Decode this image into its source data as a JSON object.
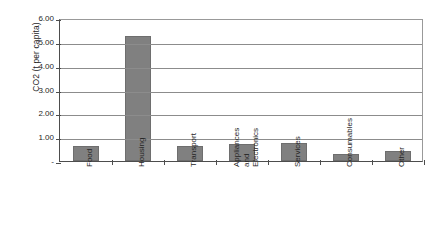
{
  "chart_data": {
    "type": "bar",
    "title": "",
    "xlabel": "",
    "ylabel": "CO2 (t per capita)",
    "categories": [
      "Food",
      "Housing",
      "Transport",
      "Appliances and Electronics",
      "Services",
      "Consumables",
      "Other"
    ],
    "category_lines": [
      [
        "Food"
      ],
      [
        "Housing"
      ],
      [
        "Transport"
      ],
      [
        "Appliances",
        "and",
        "Electronics"
      ],
      [
        "Services"
      ],
      [
        "Consumables"
      ],
      [
        "Other"
      ]
    ],
    "values": [
      0.63,
      5.26,
      0.62,
      0.7,
      0.75,
      0.28,
      0.41
    ],
    "ylim": [
      0,
      6
    ],
    "ytick_values": [
      6,
      5,
      4,
      3,
      2,
      1,
      0
    ],
    "ytick_labels": [
      "6.00",
      "5.00",
      "4.00",
      "3.00",
      "2.00",
      "1.00",
      "-"
    ],
    "grid": true,
    "legend": false,
    "bar_color": "#808080",
    "gridline_color": "#8c8c8c",
    "axis_color": "#4d4d4d",
    "background_color": "#ffffff"
  }
}
